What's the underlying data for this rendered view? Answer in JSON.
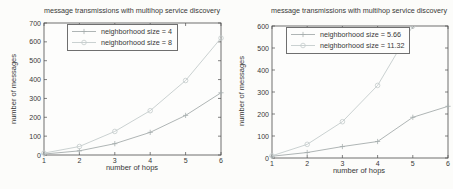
{
  "figure": {
    "background": "#fcfcfa",
    "axis_color": "#4d4d4d",
    "text_color": "#383838",
    "series_plus_color": "#a6adad",
    "series_circle_color": "#c4cccc"
  },
  "chart_data": [
    {
      "type": "line",
      "title": "message transmissions with multihop service discovery",
      "xlabel": "number of hops",
      "ylabel": "number of messages",
      "xlim": [
        1,
        6
      ],
      "ylim": [
        0,
        700
      ],
      "xtick_step": 1,
      "ytick_step": 100,
      "grid": false,
      "legend_position": "upper-center-inside",
      "x": [
        1,
        2,
        3,
        4,
        5,
        6
      ],
      "series": [
        {
          "name": "neighborhood size = 4",
          "marker": "plus",
          "color": "#a6adad",
          "values": [
            5,
            22,
            60,
            120,
            210,
            330
          ]
        },
        {
          "name": "neighborhood size = 8",
          "marker": "circle",
          "color": "#c4cccc",
          "values": [
            10,
            45,
            125,
            235,
            395,
            620
          ]
        }
      ]
    },
    {
      "type": "line",
      "title": "message transmissions with multihop service discovery",
      "xlabel": "number of hops",
      "ylabel": "number of messages",
      "xlim": [
        1,
        6
      ],
      "ylim": [
        0,
        600
      ],
      "xtick_step": 1,
      "ytick_step": 100,
      "grid": false,
      "legend_position": "upper-left-inside",
      "x": [
        1,
        2,
        3,
        4,
        5,
        6
      ],
      "series": [
        {
          "name": "neighborhood size = 5.66",
          "marker": "plus",
          "color": "#a6adad",
          "values": [
            8,
            25,
            52,
            75,
            185,
            235
          ]
        },
        {
          "name": "neighborhood size = 11.32",
          "marker": "circle",
          "color": "#c4cccc",
          "x": [
            1,
            2,
            3,
            4,
            5
          ],
          "values": [
            10,
            62,
            165,
            330,
            600
          ]
        }
      ]
    }
  ]
}
